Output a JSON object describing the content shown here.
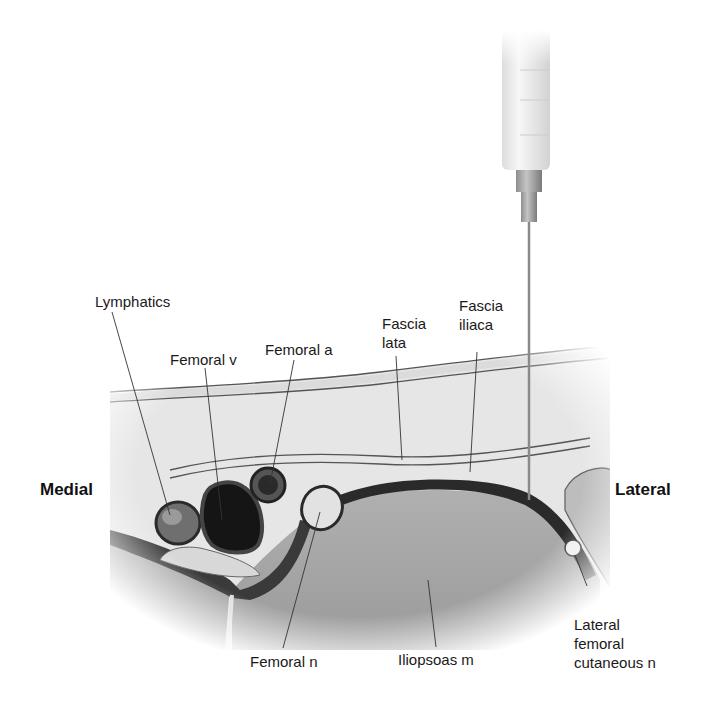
{
  "diagram": {
    "type": "anatomical cross-section",
    "orientation": {
      "left_label": "Medial",
      "right_label": "Lateral"
    },
    "labels": {
      "lymphatics": "Lymphatics",
      "femoral_v": "Femoral v",
      "femoral_a": "Femoral a",
      "fascia_lata_1": "Fascia",
      "fascia_lata_2": "lata",
      "fascia_iliaca_1": "Fascia",
      "fascia_iliaca_2": "iliaca",
      "femoral_n": "Femoral n",
      "iliopsoas_m": "Iliopsoas m",
      "lfcn_1": "Lateral",
      "lfcn_2": "femoral",
      "lfcn_3": "cutaneous n"
    },
    "colors": {
      "background": "#ffffff",
      "tissue_light": "#e4e4e4",
      "muscle": "#a9a9a9",
      "fascia_dark": "#2a2a2a",
      "vessel_dark": "#1c1c1c",
      "syringe": "#eeeeee",
      "needle": "#8a8a8a"
    }
  }
}
